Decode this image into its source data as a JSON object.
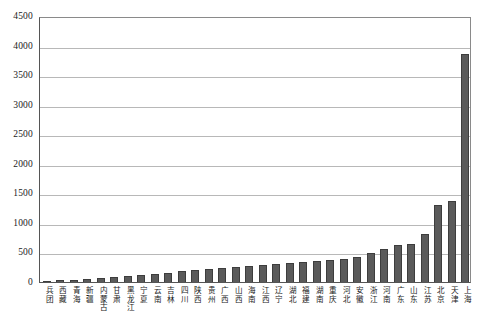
{
  "chart_data": {
    "type": "bar",
    "title": "",
    "subtitle": "",
    "xlabel": "",
    "ylabel": "",
    "ylim": [
      0,
      4500
    ],
    "ytick_step": 500,
    "yticks": [
      0,
      500,
      1000,
      1500,
      2000,
      2500,
      3000,
      3500,
      4000,
      4500
    ],
    "ytick_labels": [
      "0",
      "500",
      "1000",
      "1500",
      "2000",
      "2500",
      "3000",
      "3500",
      "4000",
      "4500"
    ],
    "grid": true,
    "grid_axis": "y",
    "legend": false,
    "legend_position": "none",
    "bar_color": "#5a5a5a",
    "bar_edge_color": "#3d3d3d",
    "grid_color": "#b8b8b8",
    "axis_color": "#555555",
    "categories": [
      "兵团",
      "西藏",
      "青海",
      "新疆",
      "内蒙古",
      "甘肃",
      "黑龙江",
      "宁夏",
      "云南",
      "吉林",
      "四川",
      "陕西",
      "贵州",
      "广西",
      "山西",
      "海南",
      "江西",
      "辽宁",
      "湖北",
      "福建",
      "湖南",
      "重庆",
      "河北",
      "安徽",
      "浙江",
      "河南",
      "广东",
      "山东",
      "江苏",
      "北京",
      "天津",
      "上海"
    ],
    "values": [
      20,
      30,
      40,
      55,
      70,
      90,
      105,
      120,
      140,
      160,
      180,
      200,
      215,
      230,
      250,
      265,
      285,
      300,
      320,
      340,
      355,
      375,
      395,
      420,
      490,
      560,
      620,
      650,
      820,
      1300,
      1370,
      3850
    ]
  }
}
